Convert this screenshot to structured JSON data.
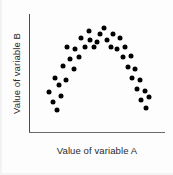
{
  "chart_data": {
    "type": "scatter",
    "title": "",
    "xlabel": "Value of variable A",
    "ylabel": "Value of variable B",
    "xlim": [
      0,
      100
    ],
    "ylim": [
      0,
      100
    ],
    "grid": false,
    "legend": null,
    "axis_ticks": false,
    "tick_labels": {
      "x": [],
      "y": []
    },
    "annotations": [],
    "marker": {
      "shape": "circle",
      "color": "#000000",
      "size_px": 5
    },
    "relationship": "inverted-U (curvilinear)",
    "n_points": 38,
    "points": [
      {
        "x": 20.6,
        "y": 18.6
      },
      {
        "x": 17.6,
        "y": 25.4
      },
      {
        "x": 23.5,
        "y": 30.5
      },
      {
        "x": 14.7,
        "y": 33.9
      },
      {
        "x": 22.1,
        "y": 39.8
      },
      {
        "x": 19.1,
        "y": 45.8
      },
      {
        "x": 27.2,
        "y": 44.1
      },
      {
        "x": 25.0,
        "y": 55.9
      },
      {
        "x": 33.1,
        "y": 53.4
      },
      {
        "x": 30.1,
        "y": 61.9
      },
      {
        "x": 36.8,
        "y": 63.6
      },
      {
        "x": 33.8,
        "y": 70.3
      },
      {
        "x": 27.9,
        "y": 72.0
      },
      {
        "x": 41.2,
        "y": 72.0
      },
      {
        "x": 38.2,
        "y": 79.7
      },
      {
        "x": 44.9,
        "y": 78.0
      },
      {
        "x": 47.8,
        "y": 72.0
      },
      {
        "x": 44.1,
        "y": 85.6
      },
      {
        "x": 52.2,
        "y": 83.1
      },
      {
        "x": 50.0,
        "y": 76.3
      },
      {
        "x": 55.1,
        "y": 88.1
      },
      {
        "x": 57.4,
        "y": 78.0
      },
      {
        "x": 61.8,
        "y": 83.1
      },
      {
        "x": 60.3,
        "y": 72.0
      },
      {
        "x": 66.9,
        "y": 79.7
      },
      {
        "x": 64.7,
        "y": 70.3
      },
      {
        "x": 70.6,
        "y": 72.0
      },
      {
        "x": 69.1,
        "y": 63.6
      },
      {
        "x": 75.0,
        "y": 64.4
      },
      {
        "x": 72.8,
        "y": 55.1
      },
      {
        "x": 77.9,
        "y": 53.4
      },
      {
        "x": 75.7,
        "y": 45.8
      },
      {
        "x": 81.6,
        "y": 44.1
      },
      {
        "x": 79.4,
        "y": 36.4
      },
      {
        "x": 85.3,
        "y": 34.7
      },
      {
        "x": 82.4,
        "y": 27.1
      },
      {
        "x": 88.2,
        "y": 29.7
      },
      {
        "x": 86.0,
        "y": 20.3
      }
    ]
  },
  "axes": {
    "x_label": "Value of variable A",
    "y_label": "Value of variable B"
  },
  "colors": {
    "point": "#000000",
    "axis": "#4a4a4a",
    "label_text": "#2b2b2b",
    "background": "#fdfdfd"
  }
}
